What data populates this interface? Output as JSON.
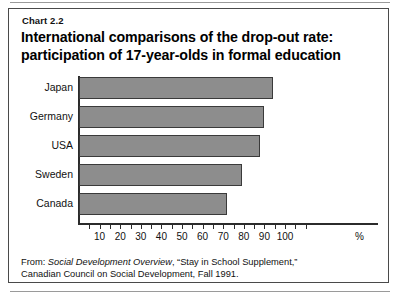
{
  "figure": {
    "chart_number": "Chart 2.2",
    "title_line1": "International comparisons of the drop-out rate:",
    "title_line2": "participation of 17-year-olds in formal education",
    "percent_symbol": "%",
    "bar_color": "#8d8d8d",
    "bar_border_color": "#3a3a3a",
    "axis_color": "#2b2b2b",
    "frame_color": "#4a4a4a"
  },
  "source": {
    "line1_prefix": "From: ",
    "line1_italic": "Social Development Overview",
    "line1_suffix": ", “Stay in School Supplement,”",
    "line2": "Canadian Council on Social Development, Fall 1991."
  },
  "chart_data": {
    "type": "bar",
    "orientation": "horizontal",
    "title": "International comparisons of the drop-out rate: participation of 17-year-olds in formal education",
    "categories": [
      "Japan",
      "Germany",
      "USA",
      "Sweden",
      "Canada"
    ],
    "values": [
      94,
      90,
      88,
      79,
      72
    ],
    "xlabel": "%",
    "ylabel": "",
    "xlim": [
      0,
      110
    ],
    "xticks_labeled": [
      10,
      20,
      30,
      40,
      50,
      60,
      70,
      80,
      90,
      100
    ],
    "xticks_minor_step": 5,
    "grid": false,
    "legend": false,
    "series": [
      {
        "name": "Participation of 17-year-olds in formal education (%)",
        "values": [
          94,
          90,
          88,
          79,
          72
        ]
      }
    ]
  }
}
